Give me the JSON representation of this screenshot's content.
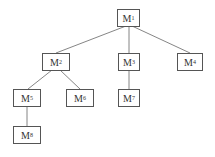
{
  "diagram": {
    "type": "tree",
    "nodes": [
      {
        "id": "M1",
        "label": "M",
        "sub": "1"
      },
      {
        "id": "M2",
        "label": "M",
        "sub": "2"
      },
      {
        "id": "M3",
        "label": "M",
        "sub": "3"
      },
      {
        "id": "M4",
        "label": "M",
        "sub": "4"
      },
      {
        "id": "M5",
        "label": "M",
        "sub": "5"
      },
      {
        "id": "M6",
        "label": "M",
        "sub": "6"
      },
      {
        "id": "M7",
        "label": "M",
        "sub": "7"
      },
      {
        "id": "M8",
        "label": "M",
        "sub": "8"
      }
    ],
    "edges": [
      [
        "M1",
        "M2"
      ],
      [
        "M1",
        "M3"
      ],
      [
        "M1",
        "M4"
      ],
      [
        "M2",
        "M5"
      ],
      [
        "M2",
        "M6"
      ],
      [
        "M3",
        "M7"
      ],
      [
        "M5",
        "M8"
      ]
    ],
    "caption": ""
  }
}
